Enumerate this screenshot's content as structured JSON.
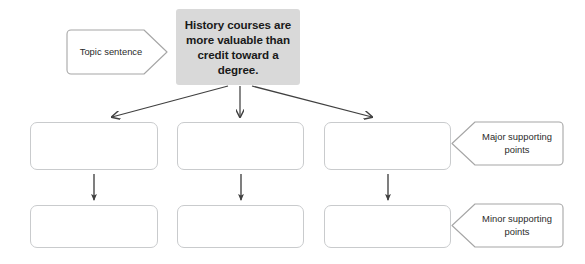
{
  "diagram": {
    "type": "hierarchy-organizer",
    "title_text": "History courses are more valuable than credit toward a degree.",
    "thesis": {
      "label": "History courses are more valuable than credit toward a degree.",
      "fill_color": "#d9d9d9",
      "text_color": "#1a1a1a"
    },
    "callouts": {
      "topic": "Topic sentence",
      "major": "Major supporting points",
      "minor": "Minor supporting points"
    },
    "rows": [
      {
        "name": "major-supporting-row",
        "boxes": [
          {
            "label": ""
          },
          {
            "label": ""
          },
          {
            "label": ""
          }
        ]
      },
      {
        "name": "minor-supporting-row",
        "boxes": [
          {
            "label": ""
          },
          {
            "label": ""
          },
          {
            "label": ""
          }
        ]
      }
    ],
    "colors": {
      "box_border": "#c9cbcd",
      "box_fill": "#ffffff",
      "arrow": "#404040",
      "callout_border": "#a6a6a6",
      "background": "#ffffff"
    }
  }
}
